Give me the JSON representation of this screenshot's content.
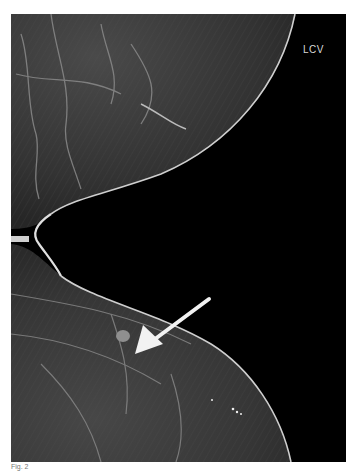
{
  "image": {
    "type": "mammogram",
    "view_label": "LCV",
    "background_color": "#000000",
    "tissue_color": "#3a3a3a",
    "border_color": "#ffffff"
  },
  "annotation": {
    "type": "arrow",
    "color": "#f2f2f2",
    "points_to": "lesion"
  },
  "caption": {
    "text": "Fig. 2"
  }
}
